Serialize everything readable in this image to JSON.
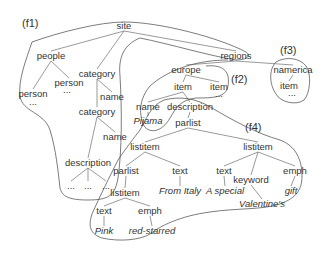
{
  "diagram": {
    "type": "xml-tree-fragments",
    "fragment_labels": [
      {
        "id": "f1",
        "label": "(f1)",
        "x": 22,
        "y": 27
      },
      {
        "id": "f2",
        "label": "(f2)",
        "x": 231,
        "y": 83
      },
      {
        "id": "f3",
        "label": "(f3)",
        "x": 280,
        "y": 54
      },
      {
        "id": "f4",
        "label": "(f4)",
        "x": 245,
        "y": 131
      }
    ],
    "nodes": [
      {
        "id": "site",
        "label": "site",
        "x": 124,
        "y": 29,
        "italic": false
      },
      {
        "id": "people",
        "label": "people",
        "x": 51,
        "y": 59,
        "italic": false
      },
      {
        "id": "person1",
        "label": "person",
        "x": 33,
        "y": 97,
        "italic": false
      },
      {
        "id": "person1_dots",
        "label": "...",
        "x": 33,
        "y": 105,
        "italic": false
      },
      {
        "id": "person2",
        "label": "person",
        "x": 69,
        "y": 86,
        "italic": false
      },
      {
        "id": "person2_dots",
        "label": "...",
        "x": 67,
        "y": 93,
        "italic": false
      },
      {
        "id": "category1",
        "label": "category",
        "x": 97,
        "y": 77,
        "italic": false
      },
      {
        "id": "name1",
        "label": "name",
        "x": 112,
        "y": 100,
        "italic": false
      },
      {
        "id": "category2",
        "label": "category",
        "x": 97,
        "y": 115,
        "italic": false
      },
      {
        "id": "name2",
        "label": "name",
        "x": 115,
        "y": 140,
        "italic": false
      },
      {
        "id": "description1",
        "label": "description",
        "x": 88,
        "y": 166,
        "italic": false
      },
      {
        "id": "desc_dots1",
        "label": "...",
        "x": 71,
        "y": 189,
        "italic": false
      },
      {
        "id": "desc_dots2",
        "label": "...",
        "x": 88,
        "y": 189,
        "italic": false
      },
      {
        "id": "desc_dots3",
        "label": "...",
        "x": 106,
        "y": 189,
        "italic": false
      },
      {
        "id": "regions",
        "label": "regions",
        "x": 236,
        "y": 59,
        "italic": false
      },
      {
        "id": "namerica",
        "label": "namerica",
        "x": 293,
        "y": 73,
        "italic": false
      },
      {
        "id": "item_na",
        "label": "item",
        "x": 289,
        "y": 89,
        "italic": false
      },
      {
        "id": "item_na_dots",
        "label": "...",
        "x": 292,
        "y": 96,
        "italic": false
      },
      {
        "id": "europe",
        "label": "europe",
        "x": 186,
        "y": 73,
        "italic": false
      },
      {
        "id": "item_eu1",
        "label": "item",
        "x": 183,
        "y": 90,
        "italic": false
      },
      {
        "id": "item_eu2",
        "label": "item",
        "x": 219,
        "y": 90,
        "italic": false
      },
      {
        "id": "item_eu2_dots",
        "label": "...",
        "x": 219,
        "y": 97,
        "italic": false
      },
      {
        "id": "name3",
        "label": "name",
        "x": 148,
        "y": 110,
        "italic": false
      },
      {
        "id": "pijama",
        "label": "Pijama",
        "x": 148,
        "y": 124,
        "italic": true
      },
      {
        "id": "description2",
        "label": "description",
        "x": 190,
        "y": 110,
        "italic": false
      },
      {
        "id": "parlist1",
        "label": "parlist",
        "x": 188,
        "y": 126,
        "italic": false
      },
      {
        "id": "listitem1",
        "label": "listitem",
        "x": 145,
        "y": 150,
        "italic": false
      },
      {
        "id": "listitem2",
        "label": "listitem",
        "x": 258,
        "y": 150,
        "italic": false
      },
      {
        "id": "parlist2",
        "label": "parlist",
        "x": 126,
        "y": 174,
        "italic": false
      },
      {
        "id": "text1",
        "label": "text",
        "x": 180,
        "y": 174,
        "italic": false
      },
      {
        "id": "from_italy",
        "label": "From Italy",
        "x": 180,
        "y": 194,
        "italic": true
      },
      {
        "id": "text2",
        "label": "text",
        "x": 224,
        "y": 174,
        "italic": false
      },
      {
        "id": "a_special",
        "label": "A special",
        "x": 225,
        "y": 194,
        "italic": true
      },
      {
        "id": "keyword",
        "label": "keyword",
        "x": 251,
        "y": 183,
        "italic": false
      },
      {
        "id": "valentines",
        "label": "Valentine's",
        "x": 262,
        "y": 207,
        "italic": true
      },
      {
        "id": "emph1",
        "label": "emph",
        "x": 295,
        "y": 174,
        "italic": false
      },
      {
        "id": "gift",
        "label": "gift",
        "x": 291,
        "y": 194,
        "italic": true
      },
      {
        "id": "listitem3",
        "label": "listitem",
        "x": 125,
        "y": 196,
        "italic": false
      },
      {
        "id": "text3",
        "label": "text",
        "x": 104,
        "y": 214,
        "italic": false
      },
      {
        "id": "pink",
        "label": "Pink",
        "x": 104,
        "y": 234,
        "italic": true
      },
      {
        "id": "emph2",
        "label": "emph",
        "x": 150,
        "y": 214,
        "italic": false
      },
      {
        "id": "red_starred",
        "label": "red-starred",
        "x": 152,
        "y": 234,
        "italic": true
      }
    ],
    "edges": [
      [
        "site",
        "people"
      ],
      [
        "site",
        "category1"
      ],
      [
        "site",
        "regions"
      ],
      [
        "people",
        "person1"
      ],
      [
        "people",
        "person2"
      ],
      [
        "category1",
        "name1"
      ],
      [
        "category1",
        "category2"
      ],
      [
        "category2",
        "name2"
      ],
      [
        "category2",
        "description1"
      ],
      [
        "description1",
        "desc_dots1"
      ],
      [
        "description1",
        "desc_dots2"
      ],
      [
        "description1",
        "desc_dots3"
      ],
      [
        "regions",
        "europe"
      ],
      [
        "regions",
        "namerica"
      ],
      [
        "namerica",
        "item_na"
      ],
      [
        "europe",
        "item_eu1"
      ],
      [
        "europe",
        "item_eu2"
      ],
      [
        "item_eu1",
        "name3"
      ],
      [
        "item_eu1",
        "description2"
      ],
      [
        "name3",
        "pijama"
      ],
      [
        "description2",
        "parlist1"
      ],
      [
        "parlist1",
        "listitem1"
      ],
      [
        "parlist1",
        "listitem2"
      ],
      [
        "listitem1",
        "parlist2"
      ],
      [
        "listitem1",
        "text1"
      ],
      [
        "text1",
        "from_italy"
      ],
      [
        "listitem2",
        "text2"
      ],
      [
        "listitem2",
        "keyword"
      ],
      [
        "listitem2",
        "emph1"
      ],
      [
        "text2",
        "a_special"
      ],
      [
        "keyword",
        "valentines"
      ],
      [
        "emph1",
        "gift"
      ],
      [
        "parlist2",
        "listitem3"
      ],
      [
        "listitem3",
        "text3"
      ],
      [
        "listitem3",
        "emph2"
      ],
      [
        "text3",
        "pink"
      ],
      [
        "emph2",
        "red_starred"
      ]
    ]
  }
}
